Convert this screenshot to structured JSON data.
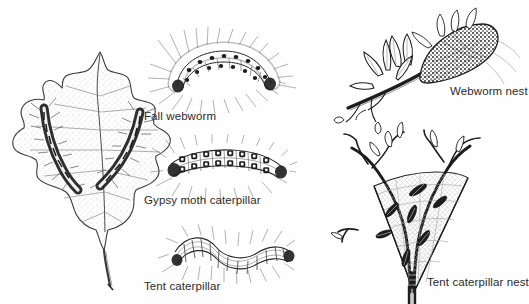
{
  "figure": {
    "kind": "line-drawing identification plate",
    "page_header_fragment": "",
    "background_color": "#ffffff",
    "ink_color": "#1d1d1d",
    "label_color": "#2b2b2b"
  },
  "labels": {
    "fall_webworm": "Fall webworm",
    "gypsy_moth_caterpillar": "Gypsy moth caterpillar",
    "tent_caterpillar": "Tent caterpillar",
    "webworm_nest": "Webworm nest",
    "tent_caterpillar_nest": "Tent caterpillar nest"
  },
  "illustrations": [
    {
      "name": "oak-leaf-with-caterpillars",
      "description": "Oak leaf with lobed margins bearing two hairy caterpillars on its surface",
      "position": "left column, full height"
    },
    {
      "name": "fall-webworm-caterpillar",
      "description": "Arched pale caterpillar densely covered in long hairs with two rows of dark dorsal spots",
      "position": "center column, top"
    },
    {
      "name": "gypsy-moth-caterpillar",
      "description": "Caterpillar with paired rows of dark raised tubercles along the back and tufts of bristles",
      "position": "center column, middle"
    },
    {
      "name": "tent-caterpillar",
      "description": "Wavy-bodied caterpillar with a pale continuous dorsal stripe and side bristles",
      "position": "center column, bottom"
    },
    {
      "name": "webworm-nest-on-branch",
      "description": "Leafy branch tip enclosed in a dense dark silken web",
      "position": "right column, top"
    },
    {
      "name": "tent-caterpillar-nest-in-crotch",
      "description": "Triangular silk tent spun in the fork of a branch with caterpillars inside",
      "position": "right column, bottom"
    }
  ]
}
